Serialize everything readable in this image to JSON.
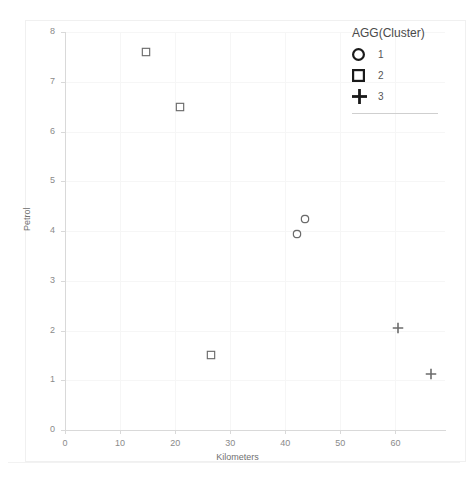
{
  "chart_data": {
    "type": "scatter",
    "title": "",
    "xlabel": "Kilometers",
    "ylabel": "Petrol",
    "xlim": [
      0,
      69
    ],
    "ylim": [
      0,
      8
    ],
    "xticks": [
      0,
      10,
      20,
      30,
      40,
      50,
      60
    ],
    "yticks": [
      0,
      1,
      2,
      3,
      4,
      5,
      6,
      7,
      8
    ],
    "grid": true,
    "legend": {
      "title": "AGG(Cluster)",
      "position": "top-right",
      "entries": [
        {
          "label": "1",
          "marker": "circle"
        },
        {
          "label": "2",
          "marker": "square"
        },
        {
          "label": "3",
          "marker": "plus"
        }
      ]
    },
    "series": [
      {
        "name": "1",
        "marker": "circle",
        "points": [
          {
            "x": 43.6,
            "y": 4.25
          },
          {
            "x": 42.2,
            "y": 3.94
          }
        ]
      },
      {
        "name": "2",
        "marker": "square",
        "points": [
          {
            "x": 14.7,
            "y": 7.6
          },
          {
            "x": 20.9,
            "y": 6.5
          },
          {
            "x": 26.5,
            "y": 1.5
          }
        ]
      },
      {
        "name": "3",
        "marker": "plus",
        "points": [
          {
            "x": 60.4,
            "y": 2.05
          },
          {
            "x": 66.4,
            "y": 1.12
          }
        ]
      }
    ]
  },
  "axes": {
    "x_tick_labels": [
      "0",
      "10",
      "20",
      "30",
      "40",
      "50",
      "60"
    ],
    "y_tick_labels": [
      "0",
      "1",
      "2",
      "3",
      "4",
      "5",
      "6",
      "7",
      "8"
    ],
    "x_title": "Kilometers",
    "y_title": "Petrol"
  },
  "legend": {
    "title": "AGG(Cluster)",
    "items": [
      {
        "label": "1"
      },
      {
        "label": "2"
      },
      {
        "label": "3"
      }
    ]
  },
  "colors": {
    "marker": "#6b6b6b",
    "legend_marker": "#1a1a1a",
    "grid": "#f6f6f6",
    "axis": "#d9d9d9",
    "tick_text": "#8a8a8a",
    "title_text": "#4a4a4a",
    "background": "#ffffff"
  }
}
